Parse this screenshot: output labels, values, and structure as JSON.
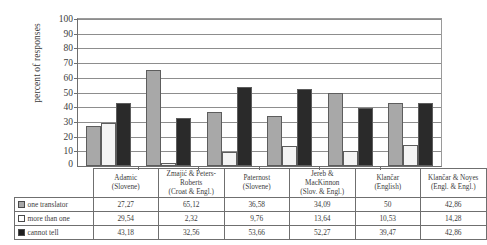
{
  "chart_data": {
    "type": "bar",
    "title": "",
    "xlabel": "",
    "ylabel": "percent of responses",
    "ylim": [
      0,
      100
    ],
    "ytick_step": 10,
    "yticks": [
      100,
      90,
      80,
      70,
      60,
      50,
      40,
      30,
      20,
      10,
      0
    ],
    "grid": true,
    "legend_position": "table-first-column",
    "categories": [
      "Adamic\n(Slovene)",
      "Zmajić & Peters-Roberts\n(Croat & Engl.)",
      "Paternost\n(Slovene)",
      "Jereb & MacKinnon\n(Slov. & Engl.)",
      "Klančar\n(English)",
      "Klančar & Noyes\n(Engl. & Engl.)"
    ],
    "series": [
      {
        "name": "one translator",
        "swatch": "gray",
        "color": "#a8a8a8",
        "values": [
          27.27,
          65.12,
          36.58,
          34.09,
          50,
          42.86
        ],
        "labels": [
          "27,27",
          "65,12",
          "36,58",
          "34,09",
          "50",
          "42,86"
        ]
      },
      {
        "name": "more than one",
        "swatch": "white",
        "color": "#f4f4f4",
        "values": [
          29.54,
          2.32,
          9.76,
          13.64,
          10.53,
          14.28
        ],
        "labels": [
          "29,54",
          "2,32",
          "9,76",
          "13,64",
          "10,53",
          "14,28"
        ]
      },
      {
        "name": "cannot tell",
        "swatch": "black",
        "color": "#2a2a2a",
        "values": [
          43.18,
          32.56,
          53.66,
          52.27,
          39.47,
          42.86
        ],
        "labels": [
          "43,18",
          "32,56",
          "53,66",
          "52,27",
          "39,47",
          "42,86"
        ]
      }
    ]
  },
  "table": {
    "columns": [
      {
        "line1": "Adamic",
        "line2": "(Slovene)",
        "line3": ""
      },
      {
        "line1": "Zmajić & Peters-",
        "line2": "Roberts",
        "line3": "(Croat & Engl.)"
      },
      {
        "line1": "Paternost",
        "line2": "(Slovene)",
        "line3": ""
      },
      {
        "line1": "Jereb &",
        "line2": "MacKinnon",
        "line3": "(Slov. & Engl.)"
      },
      {
        "line1": "Klančar",
        "line2": "(English)",
        "line3": ""
      },
      {
        "line1": "Klančar & Noyes",
        "line2": "(Engl. & Engl.)",
        "line3": ""
      }
    ],
    "rows": [
      {
        "label": "one translator",
        "swatch": "s0",
        "values": [
          "27,27",
          "65,12",
          "36,58",
          "34,09",
          "50",
          "42,86"
        ]
      },
      {
        "label": "more than one",
        "swatch": "s1",
        "values": [
          "29,54",
          "2,32",
          "9,76",
          "13,64",
          "10,53",
          "14,28"
        ]
      },
      {
        "label": "cannot tell",
        "swatch": "s2",
        "values": [
          "43,18",
          "32,56",
          "53,66",
          "52,27",
          "39,47",
          "42,86"
        ]
      }
    ]
  },
  "axis": {
    "zero_label": "0"
  }
}
